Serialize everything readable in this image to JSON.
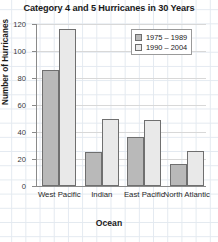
{
  "chart_data": {
    "type": "bar",
    "title": "Category 4 and 5 Hurricanes in 30 Years",
    "xlabel": "Ocean",
    "ylabel": "Number of Hurricanes",
    "categories": [
      "West Pacific",
      "Indian",
      "East Pacific",
      "North Atlantic"
    ],
    "series": [
      {
        "name": "1975 – 1989",
        "color": "#b9b9b9",
        "values": [
          86,
          25,
          36,
          16
        ]
      },
      {
        "name": "1990 – 2004",
        "color": "#e9e9e9",
        "values": [
          116,
          50,
          49,
          26
        ]
      }
    ],
    "ylim": [
      0,
      120
    ],
    "yticks": [
      0,
      20,
      40,
      60,
      80,
      100,
      120
    ],
    "grid": true,
    "legend_position": "top-right"
  }
}
